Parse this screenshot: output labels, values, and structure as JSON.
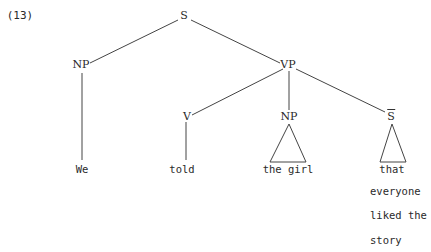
{
  "example_number": "(13)",
  "tree": {
    "root": "S",
    "subject_np": "NP",
    "vp": "VP",
    "verb": "V",
    "object_np": "NP",
    "clause": "S",
    "clause_has_bar": true
  },
  "leaves": {
    "subject": "We",
    "verb": "told",
    "object": "the girl",
    "clause_line1": "that",
    "clause_line2": "everyone",
    "clause_line3": "liked the",
    "clause_line4": "story"
  },
  "colors": {
    "ink": "#2a2a2a",
    "background": "#ffffff"
  }
}
